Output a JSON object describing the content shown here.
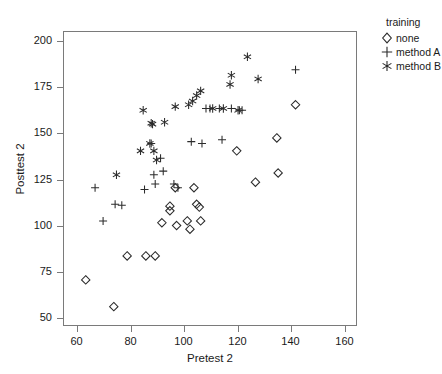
{
  "chart_data": {
    "type": "scatter",
    "title": "",
    "xlabel": "Pretest 2",
    "ylabel": "Posttest 2",
    "xlim": [
      55,
      165
    ],
    "ylim": [
      45,
      205
    ],
    "xticks": [
      60,
      80,
      100,
      120,
      140,
      160
    ],
    "yticks": [
      50,
      75,
      100,
      125,
      150,
      175,
      200
    ],
    "grid": false,
    "legend_position": "right",
    "legend_title": "training",
    "series": [
      {
        "name": "none",
        "marker": "diamond",
        "points": [
          [
            63.5,
            70
          ],
          [
            74,
            55.5
          ],
          [
            79,
            83
          ],
          [
            86,
            83
          ],
          [
            89.5,
            83
          ],
          [
            92,
            101
          ],
          [
            95,
            110
          ],
          [
            95,
            107.5
          ],
          [
            97.5,
            99.5
          ],
          [
            101.5,
            102
          ],
          [
            102.5,
            97.5
          ],
          [
            105,
            111
          ],
          [
            106,
            109.5
          ],
          [
            106.5,
            102
          ],
          [
            104,
            120
          ],
          [
            97,
            120
          ],
          [
            120,
            140
          ],
          [
            127,
            123
          ],
          [
            135,
            147
          ],
          [
            135.5,
            128
          ],
          [
            142,
            165
          ]
        ]
      },
      {
        "name": "method A",
        "marker": "plus",
        "points": [
          [
            67,
            120
          ],
          [
            70,
            102
          ],
          [
            74.5,
            111
          ],
          [
            77,
            110.5
          ],
          [
            85.5,
            119
          ],
          [
            88,
            144
          ],
          [
            89,
            127
          ],
          [
            89.5,
            122
          ],
          [
            91.5,
            136
          ],
          [
            92.5,
            129
          ],
          [
            96.5,
            122
          ],
          [
            98,
            120
          ],
          [
            103,
            145
          ],
          [
            107,
            144
          ],
          [
            114.5,
            146
          ],
          [
            108.5,
            163
          ],
          [
            110,
            163
          ],
          [
            113.5,
            163
          ],
          [
            118,
            163
          ],
          [
            121,
            162
          ],
          [
            122,
            162
          ],
          [
            142,
            184
          ]
        ]
      },
      {
        "name": "method B",
        "marker": "star",
        "points": [
          [
            75,
            127
          ],
          [
            84,
            140
          ],
          [
            85,
            162
          ],
          [
            87.5,
            144
          ],
          [
            88,
            155
          ],
          [
            88.5,
            154.5
          ],
          [
            89,
            140
          ],
          [
            90,
            135
          ],
          [
            93,
            155.5
          ],
          [
            97,
            164
          ],
          [
            102,
            165
          ],
          [
            103.5,
            167
          ],
          [
            105,
            170
          ],
          [
            106.5,
            172.5
          ],
          [
            111,
            163
          ],
          [
            115,
            163
          ],
          [
            117.5,
            176
          ],
          [
            118,
            181
          ],
          [
            120.5,
            162
          ],
          [
            124,
            191
          ],
          [
            128,
            179
          ]
        ]
      }
    ]
  },
  "legend": {
    "title": "training",
    "items": [
      {
        "label": "none",
        "marker": "diamond"
      },
      {
        "label": "method A",
        "marker": "plus"
      },
      {
        "label": "method B",
        "marker": "star"
      }
    ]
  },
  "axes": {
    "x_title": "Pretest 2",
    "y_title": "Posttest 2",
    "x_tick_labels": [
      "60",
      "80",
      "100",
      "120",
      "140",
      "160"
    ],
    "y_tick_labels": [
      "50",
      "75",
      "100",
      "125",
      "150",
      "175",
      "200"
    ]
  },
  "colors": {
    "marker": "#2b2b2b",
    "frame": "#7a7a7a",
    "text": "#1a1a1a",
    "background": "#ffffff"
  }
}
